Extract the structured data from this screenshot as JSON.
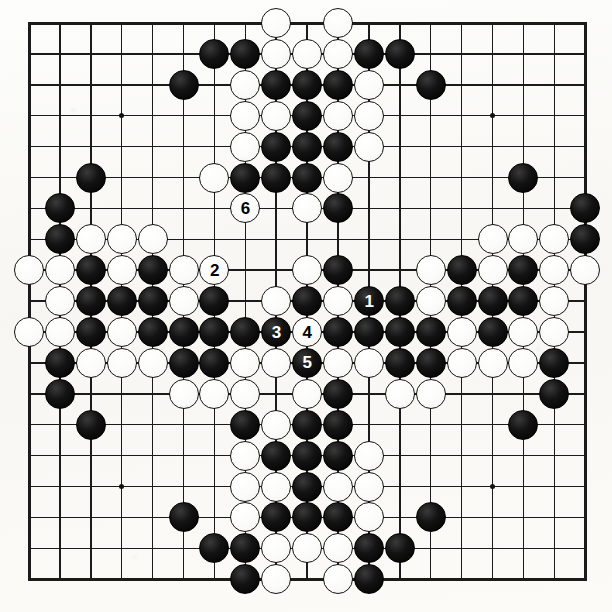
{
  "diagram": {
    "kind": "go-board-diagram",
    "board_size": 19,
    "colors": {
      "background": "#fbfaf7",
      "line": "#1b1b1b",
      "black_stone": "#111111",
      "white_stone": "#ffffff"
    },
    "geometry": {
      "origin_x": 29,
      "origin_y": 23,
      "spacing": 30.9,
      "stone_diameter": 30
    },
    "hoshi_points": [
      {
        "col": 3,
        "row": 3
      },
      {
        "col": 9,
        "row": 3
      },
      {
        "col": 15,
        "row": 3
      },
      {
        "col": 3,
        "row": 9
      },
      {
        "col": 9,
        "row": 9
      },
      {
        "col": 15,
        "row": 9
      },
      {
        "col": 3,
        "row": 15
      },
      {
        "col": 9,
        "row": 15
      },
      {
        "col": 15,
        "row": 15
      }
    ],
    "move_numbers": [
      {
        "label": "1",
        "col": 11,
        "row": 9,
        "color": "black"
      },
      {
        "label": "2",
        "col": 6,
        "row": 8,
        "color": "white"
      },
      {
        "label": "3",
        "col": 8,
        "row": 10,
        "color": "black"
      },
      {
        "label": "4",
        "col": 9,
        "row": 10,
        "color": "white"
      },
      {
        "label": "5",
        "col": 9,
        "row": 11,
        "color": "black"
      },
      {
        "label": "6",
        "col": 7,
        "row": 6,
        "color": "white"
      }
    ],
    "stones": [
      {
        "col": 8,
        "row": 0,
        "color": "white"
      },
      {
        "col": 10,
        "row": 0,
        "color": "white"
      },
      {
        "col": 6,
        "row": 1,
        "color": "black"
      },
      {
        "col": 7,
        "row": 1,
        "color": "black"
      },
      {
        "col": 8,
        "row": 1,
        "color": "white"
      },
      {
        "col": 9,
        "row": 1,
        "color": "white"
      },
      {
        "col": 10,
        "row": 1,
        "color": "white"
      },
      {
        "col": 11,
        "row": 1,
        "color": "black"
      },
      {
        "col": 12,
        "row": 1,
        "color": "black"
      },
      {
        "col": 5,
        "row": 2,
        "color": "black"
      },
      {
        "col": 7,
        "row": 2,
        "color": "white"
      },
      {
        "col": 8,
        "row": 2,
        "color": "black"
      },
      {
        "col": 9,
        "row": 2,
        "color": "black"
      },
      {
        "col": 10,
        "row": 2,
        "color": "black"
      },
      {
        "col": 11,
        "row": 2,
        "color": "white"
      },
      {
        "col": 13,
        "row": 2,
        "color": "black"
      },
      {
        "col": 7,
        "row": 3,
        "color": "white"
      },
      {
        "col": 8,
        "row": 3,
        "color": "white"
      },
      {
        "col": 9,
        "row": 3,
        "color": "black"
      },
      {
        "col": 10,
        "row": 3,
        "color": "white"
      },
      {
        "col": 11,
        "row": 3,
        "color": "white"
      },
      {
        "col": 7,
        "row": 4,
        "color": "white"
      },
      {
        "col": 8,
        "row": 4,
        "color": "black"
      },
      {
        "col": 9,
        "row": 4,
        "color": "black"
      },
      {
        "col": 10,
        "row": 4,
        "color": "black"
      },
      {
        "col": 11,
        "row": 4,
        "color": "white"
      },
      {
        "col": 2,
        "row": 5,
        "color": "black"
      },
      {
        "col": 6,
        "row": 5,
        "color": "white"
      },
      {
        "col": 7,
        "row": 5,
        "color": "black"
      },
      {
        "col": 8,
        "row": 5,
        "color": "black"
      },
      {
        "col": 9,
        "row": 5,
        "color": "black"
      },
      {
        "col": 10,
        "row": 5,
        "color": "white"
      },
      {
        "col": 16,
        "row": 5,
        "color": "black"
      },
      {
        "col": 1,
        "row": 6,
        "color": "black"
      },
      {
        "col": 9,
        "row": 6,
        "color": "white"
      },
      {
        "col": 10,
        "row": 6,
        "color": "black"
      },
      {
        "col": 18,
        "row": 6,
        "color": "black"
      },
      {
        "col": 1,
        "row": 7,
        "color": "black"
      },
      {
        "col": 2,
        "row": 7,
        "color": "white"
      },
      {
        "col": 3,
        "row": 7,
        "color": "white"
      },
      {
        "col": 4,
        "row": 7,
        "color": "white"
      },
      {
        "col": 15,
        "row": 7,
        "color": "white"
      },
      {
        "col": 16,
        "row": 7,
        "color": "white"
      },
      {
        "col": 17,
        "row": 7,
        "color": "white"
      },
      {
        "col": 18,
        "row": 7,
        "color": "black"
      },
      {
        "col": 0,
        "row": 8,
        "color": "white"
      },
      {
        "col": 1,
        "row": 8,
        "color": "white"
      },
      {
        "col": 2,
        "row": 8,
        "color": "black"
      },
      {
        "col": 3,
        "row": 8,
        "color": "white"
      },
      {
        "col": 4,
        "row": 8,
        "color": "black"
      },
      {
        "col": 5,
        "row": 8,
        "color": "white"
      },
      {
        "col": 9,
        "row": 8,
        "color": "white"
      },
      {
        "col": 10,
        "row": 8,
        "color": "black"
      },
      {
        "col": 13,
        "row": 8,
        "color": "white"
      },
      {
        "col": 14,
        "row": 8,
        "color": "black"
      },
      {
        "col": 15,
        "row": 8,
        "color": "white"
      },
      {
        "col": 16,
        "row": 8,
        "color": "black"
      },
      {
        "col": 17,
        "row": 8,
        "color": "white"
      },
      {
        "col": 18,
        "row": 8,
        "color": "white"
      },
      {
        "col": 1,
        "row": 9,
        "color": "white"
      },
      {
        "col": 2,
        "row": 9,
        "color": "black"
      },
      {
        "col": 3,
        "row": 9,
        "color": "black"
      },
      {
        "col": 4,
        "row": 9,
        "color": "black"
      },
      {
        "col": 5,
        "row": 9,
        "color": "white"
      },
      {
        "col": 6,
        "row": 9,
        "color": "black"
      },
      {
        "col": 8,
        "row": 9,
        "color": "white"
      },
      {
        "col": 9,
        "row": 9,
        "color": "black"
      },
      {
        "col": 10,
        "row": 9,
        "color": "white"
      },
      {
        "col": 12,
        "row": 9,
        "color": "black"
      },
      {
        "col": 13,
        "row": 9,
        "color": "white"
      },
      {
        "col": 14,
        "row": 9,
        "color": "black"
      },
      {
        "col": 15,
        "row": 9,
        "color": "black"
      },
      {
        "col": 16,
        "row": 9,
        "color": "black"
      },
      {
        "col": 17,
        "row": 9,
        "color": "white"
      },
      {
        "col": 0,
        "row": 10,
        "color": "white"
      },
      {
        "col": 1,
        "row": 10,
        "color": "white"
      },
      {
        "col": 2,
        "row": 10,
        "color": "black"
      },
      {
        "col": 3,
        "row": 10,
        "color": "white"
      },
      {
        "col": 4,
        "row": 10,
        "color": "black"
      },
      {
        "col": 5,
        "row": 10,
        "color": "black"
      },
      {
        "col": 6,
        "row": 10,
        "color": "black"
      },
      {
        "col": 7,
        "row": 10,
        "color": "black"
      },
      {
        "col": 10,
        "row": 10,
        "color": "black"
      },
      {
        "col": 11,
        "row": 10,
        "color": "black"
      },
      {
        "col": 12,
        "row": 10,
        "color": "black"
      },
      {
        "col": 13,
        "row": 10,
        "color": "black"
      },
      {
        "col": 14,
        "row": 10,
        "color": "white"
      },
      {
        "col": 15,
        "row": 10,
        "color": "black"
      },
      {
        "col": 16,
        "row": 10,
        "color": "white"
      },
      {
        "col": 17,
        "row": 10,
        "color": "white"
      },
      {
        "col": 1,
        "row": 11,
        "color": "black"
      },
      {
        "col": 2,
        "row": 11,
        "color": "white"
      },
      {
        "col": 3,
        "row": 11,
        "color": "white"
      },
      {
        "col": 4,
        "row": 11,
        "color": "white"
      },
      {
        "col": 5,
        "row": 11,
        "color": "black"
      },
      {
        "col": 6,
        "row": 11,
        "color": "black"
      },
      {
        "col": 7,
        "row": 11,
        "color": "white"
      },
      {
        "col": 8,
        "row": 11,
        "color": "white"
      },
      {
        "col": 10,
        "row": 11,
        "color": "white"
      },
      {
        "col": 11,
        "row": 11,
        "color": "white"
      },
      {
        "col": 12,
        "row": 11,
        "color": "black"
      },
      {
        "col": 13,
        "row": 11,
        "color": "black"
      },
      {
        "col": 14,
        "row": 11,
        "color": "white"
      },
      {
        "col": 15,
        "row": 11,
        "color": "white"
      },
      {
        "col": 16,
        "row": 11,
        "color": "white"
      },
      {
        "col": 17,
        "row": 11,
        "color": "black"
      },
      {
        "col": 1,
        "row": 12,
        "color": "black"
      },
      {
        "col": 5,
        "row": 12,
        "color": "white"
      },
      {
        "col": 6,
        "row": 12,
        "color": "white"
      },
      {
        "col": 7,
        "row": 12,
        "color": "white"
      },
      {
        "col": 9,
        "row": 12,
        "color": "white"
      },
      {
        "col": 10,
        "row": 12,
        "color": "black"
      },
      {
        "col": 12,
        "row": 12,
        "color": "white"
      },
      {
        "col": 13,
        "row": 12,
        "color": "white"
      },
      {
        "col": 17,
        "row": 12,
        "color": "black"
      },
      {
        "col": 2,
        "row": 13,
        "color": "black"
      },
      {
        "col": 7,
        "row": 13,
        "color": "black"
      },
      {
        "col": 8,
        "row": 13,
        "color": "white"
      },
      {
        "col": 9,
        "row": 13,
        "color": "black"
      },
      {
        "col": 10,
        "row": 13,
        "color": "black"
      },
      {
        "col": 16,
        "row": 13,
        "color": "black"
      },
      {
        "col": 7,
        "row": 14,
        "color": "white"
      },
      {
        "col": 8,
        "row": 14,
        "color": "black"
      },
      {
        "col": 9,
        "row": 14,
        "color": "black"
      },
      {
        "col": 10,
        "row": 14,
        "color": "black"
      },
      {
        "col": 11,
        "row": 14,
        "color": "white"
      },
      {
        "col": 7,
        "row": 15,
        "color": "white"
      },
      {
        "col": 8,
        "row": 15,
        "color": "white"
      },
      {
        "col": 9,
        "row": 15,
        "color": "black"
      },
      {
        "col": 10,
        "row": 15,
        "color": "white"
      },
      {
        "col": 11,
        "row": 15,
        "color": "white"
      },
      {
        "col": 5,
        "row": 16,
        "color": "black"
      },
      {
        "col": 7,
        "row": 16,
        "color": "white"
      },
      {
        "col": 8,
        "row": 16,
        "color": "black"
      },
      {
        "col": 9,
        "row": 16,
        "color": "black"
      },
      {
        "col": 10,
        "row": 16,
        "color": "black"
      },
      {
        "col": 11,
        "row": 16,
        "color": "white"
      },
      {
        "col": 13,
        "row": 16,
        "color": "black"
      },
      {
        "col": 6,
        "row": 17,
        "color": "black"
      },
      {
        "col": 7,
        "row": 17,
        "color": "black"
      },
      {
        "col": 8,
        "row": 17,
        "color": "white"
      },
      {
        "col": 9,
        "row": 17,
        "color": "white"
      },
      {
        "col": 10,
        "row": 17,
        "color": "white"
      },
      {
        "col": 11,
        "row": 17,
        "color": "black"
      },
      {
        "col": 12,
        "row": 17,
        "color": "black"
      },
      {
        "col": 7,
        "row": 18,
        "color": "black"
      },
      {
        "col": 8,
        "row": 18,
        "color": "white"
      },
      {
        "col": 10,
        "row": 18,
        "color": "white"
      },
      {
        "col": 11,
        "row": 18,
        "color": "black"
      }
    ]
  }
}
